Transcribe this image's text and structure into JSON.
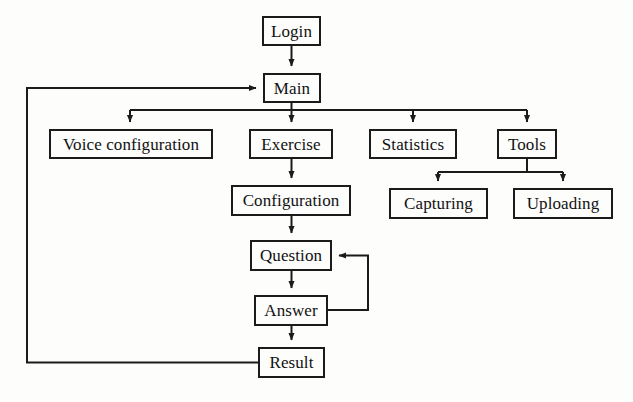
{
  "diagram": {
    "background_color": "#fdfdfc",
    "line_color": "#1b1b1b",
    "text_color": "#111111",
    "nodes": [
      {
        "id": "login",
        "label": "Login",
        "x": 262,
        "y": 16,
        "w": 59,
        "h": 30
      },
      {
        "id": "main",
        "label": "Main",
        "x": 263,
        "y": 73,
        "w": 58,
        "h": 30
      },
      {
        "id": "voice",
        "label": "Voice configuration",
        "x": 49,
        "y": 129,
        "w": 164,
        "h": 30
      },
      {
        "id": "exercise",
        "label": "Exercise",
        "x": 249,
        "y": 129,
        "w": 84,
        "h": 30
      },
      {
        "id": "stats",
        "label": "Statistics",
        "x": 369,
        "y": 129,
        "w": 88,
        "h": 30
      },
      {
        "id": "tools",
        "label": "Tools",
        "x": 497,
        "y": 129,
        "w": 60,
        "h": 30
      },
      {
        "id": "capture",
        "label": "Capturing",
        "x": 389,
        "y": 188,
        "w": 99,
        "h": 31
      },
      {
        "id": "upload",
        "label": "Uploading",
        "x": 513,
        "y": 188,
        "w": 100,
        "h": 31
      },
      {
        "id": "config",
        "label": "Configuration",
        "x": 231,
        "y": 185,
        "w": 120,
        "h": 31
      },
      {
        "id": "question",
        "label": "Question",
        "x": 250,
        "y": 240,
        "w": 82,
        "h": 31
      },
      {
        "id": "answer",
        "label": "Answer",
        "x": 254,
        "y": 295,
        "w": 74,
        "h": 31
      },
      {
        "id": "result",
        "label": "Result",
        "x": 258,
        "y": 347,
        "w": 67,
        "h": 31
      }
    ],
    "edges": [
      {
        "id": "login-main",
        "from": "login",
        "to": "main",
        "kind": "straight-down"
      },
      {
        "id": "main-voice",
        "from": "main",
        "to": "voice",
        "kind": "fan-down"
      },
      {
        "id": "main-exercise",
        "from": "main",
        "to": "exercise",
        "kind": "fan-down"
      },
      {
        "id": "main-statistics",
        "from": "main",
        "to": "stats",
        "kind": "fan-down"
      },
      {
        "id": "main-tools",
        "from": "main",
        "to": "tools",
        "kind": "fan-down"
      },
      {
        "id": "tools-capturing",
        "from": "tools",
        "to": "capture",
        "kind": "fan-down"
      },
      {
        "id": "tools-uploading",
        "from": "tools",
        "to": "upload",
        "kind": "fan-down"
      },
      {
        "id": "exercise-config",
        "from": "exercise",
        "to": "config",
        "kind": "straight-down"
      },
      {
        "id": "config-question",
        "from": "config",
        "to": "question",
        "kind": "straight-down"
      },
      {
        "id": "question-answer",
        "from": "question",
        "to": "answer",
        "kind": "straight-down"
      },
      {
        "id": "answer-question",
        "from": "answer",
        "to": "question",
        "kind": "loop-right"
      },
      {
        "id": "answer-result",
        "from": "answer",
        "to": "result",
        "kind": "straight-down"
      },
      {
        "id": "result-main",
        "from": "result",
        "to": "main",
        "kind": "feedback-left"
      }
    ]
  }
}
